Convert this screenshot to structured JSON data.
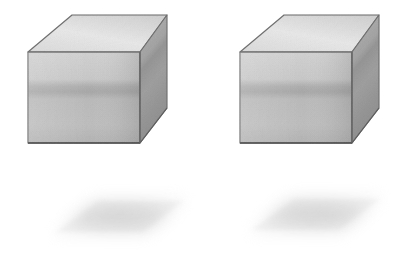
{
  "scene": {
    "title": "Two identical light gray cubes with cast shadows",
    "width": 398,
    "height": 257,
    "background_color": "#ffffff",
    "object_count": 2,
    "projection": "isometric",
    "render_style": "pencil-shaded grayscale illustration"
  },
  "palette": {
    "background": "#ffffff",
    "top_face": "#f1f1f1",
    "top_face_far": "#e6e6e6",
    "front_face_upper": "#e3e3e3",
    "front_face_band": "#cfcfcf",
    "front_face_lower": "#dcdcdc",
    "side_face_upper": "#d2d2d2",
    "side_face_lower": "#c2c2c2",
    "edge_stroke": "#a9a9a9",
    "bottom_edge_stroke": "#8f8f8f",
    "shadow_core": "#b9b9b9",
    "shadow_edge": "#e9e9e9"
  },
  "objects": [
    {
      "name": "cube-left",
      "label": "Left cube",
      "position": {
        "x": 28,
        "y": 14
      },
      "size": {
        "width": 140,
        "height": 130
      },
      "faces": [
        {
          "name": "top",
          "label": "Top face",
          "tone": "#f1f1f1"
        },
        {
          "name": "front",
          "label": "Front face",
          "tone": "#dfdfdf"
        },
        {
          "name": "right",
          "label": "Right side face",
          "tone": "#c8c8c8"
        }
      ],
      "shadow": {
        "name": "shadow-left",
        "label": "Left cube cast shadow",
        "center": {
          "x": 108,
          "y": 218
        },
        "size": {
          "width": 155,
          "height": 46
        },
        "shape": "blurred parallelogram",
        "opacity": 0.42
      }
    },
    {
      "name": "cube-right",
      "label": "Right cube",
      "position": {
        "x": 240,
        "y": 14
      },
      "size": {
        "width": 140,
        "height": 130
      },
      "faces": [
        {
          "name": "top",
          "label": "Top face",
          "tone": "#f1f1f1"
        },
        {
          "name": "front",
          "label": "Front face",
          "tone": "#dfdfdf"
        },
        {
          "name": "right",
          "label": "Right side face",
          "tone": "#c8c8c8"
        }
      ],
      "shadow": {
        "name": "shadow-right",
        "label": "Right cube cast shadow",
        "center": {
          "x": 303,
          "y": 216
        },
        "size": {
          "width": 155,
          "height": 46
        },
        "shape": "blurred parallelogram",
        "opacity": 0.42
      }
    }
  ],
  "geometry": {
    "cube_left": {
      "top_face_points": "28,52 72,15 167,15 140,52",
      "front_face_points": "28,52 140,52 140,143 28,143",
      "side_face_points": "140,52 167,15 167,108 140,143"
    },
    "cube_right": {
      "top_face_points": "240,52 284,15 379,15 352,52",
      "front_face_points": "240,52 352,52 352,143 240,143",
      "side_face_points": "352,52 379,15 379,108 352,143"
    },
    "shading_band": {
      "label": "Horizontal tonal band across front faces",
      "y": 88,
      "height": 10
    }
  }
}
